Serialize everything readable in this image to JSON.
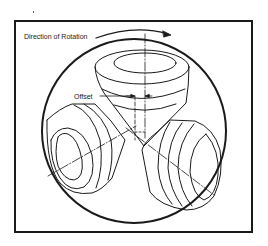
{
  "diagram": {
    "labels": {
      "rotation": "Direction of Rotation",
      "offset": "Offset"
    },
    "colors": {
      "line": "#1a1a1a",
      "background": "#ffffff"
    },
    "components": [
      "borehole-circle",
      "top-cone",
      "left-cone",
      "right-cone",
      "rotation-arrow",
      "offset-dimension",
      "center-axis"
    ]
  }
}
